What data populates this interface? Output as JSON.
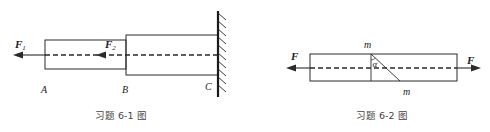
{
  "figures": [
    {
      "id": "6-1",
      "caption": "习题 6-1 图",
      "labels": {
        "force_1": "F",
        "force_1_sub": "1",
        "force_2": "F",
        "force_2_sub": "2",
        "point_a": "A",
        "point_b": "B",
        "point_c": "C"
      },
      "parts": [
        {
          "name": "segment-AB",
          "description": "thin bar section A–B"
        },
        {
          "name": "segment-BC",
          "description": "thick bar section B–C"
        },
        {
          "name": "fixed-wall",
          "description": "fixed support at C"
        }
      ]
    },
    {
      "id": "6-2",
      "caption": "习题 6-2 图",
      "labels": {
        "force_left": "F",
        "force_right": "F",
        "section_top": "m",
        "section_bottom": "m",
        "angle": "α"
      },
      "parts": [
        {
          "name": "bar",
          "description": "prismatic bar under axial tension"
        },
        {
          "name": "inclined-section",
          "description": "oblique section m–m at angle α"
        }
      ]
    }
  ],
  "colors": {
    "stroke": "#2a2a2a",
    "text": "#222222",
    "caption": "#444444",
    "background": "#ffffff"
  }
}
